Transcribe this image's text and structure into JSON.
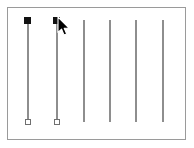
{
  "panel": {
    "name": "slider-panel",
    "background_color": "#ffffff",
    "border_color": "#9a9a9a",
    "track_color": "#8e8e8e",
    "handle_filled_color": "#111111",
    "handle_hollow_fill": "#ffffff",
    "handle_hollow_border": "#6f6f6f"
  },
  "sliders": [
    {
      "id": "slider-1",
      "x": 28,
      "track_top": 20,
      "track_bottom": 122,
      "top_handle": "filled-square",
      "bottom_handle": "hollow-square",
      "top_handle_y": 20,
      "bottom_handle_y": 122
    },
    {
      "id": "slider-2",
      "x": 57,
      "track_top": 20,
      "track_bottom": 122,
      "top_handle": "filled-square",
      "bottom_handle": "hollow-square",
      "top_handle_y": 20,
      "bottom_handle_y": 122
    },
    {
      "id": "slider-3",
      "x": 84,
      "track_top": 20,
      "track_bottom": 122,
      "top_handle": "none",
      "bottom_handle": "none"
    },
    {
      "id": "slider-4",
      "x": 110,
      "track_top": 20,
      "track_bottom": 122,
      "top_handle": "none",
      "bottom_handle": "none"
    },
    {
      "id": "slider-5",
      "x": 136,
      "track_top": 20,
      "track_bottom": 122,
      "top_handle": "none",
      "bottom_handle": "none"
    },
    {
      "id": "slider-6",
      "x": 163,
      "track_top": 20,
      "track_bottom": 122,
      "top_handle": "none",
      "bottom_handle": "none"
    }
  ],
  "cursor": {
    "name": "mouse-pointer",
    "x": 57,
    "y": 16,
    "fill": "#000000",
    "outline": "#ffffff"
  }
}
